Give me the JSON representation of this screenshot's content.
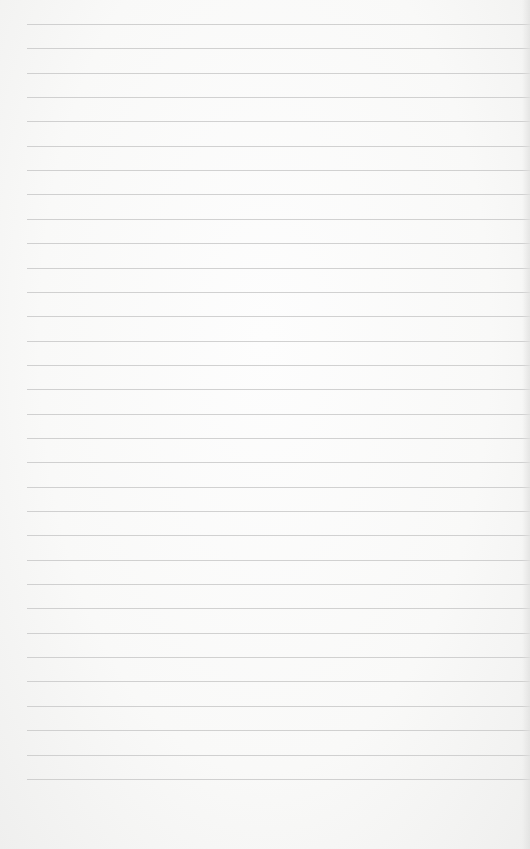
{
  "page": {
    "type": "lined-paper",
    "background_color": "#f9f9f8",
    "line_color": "#c9c9c9",
    "line_count": 32,
    "first_line_y": 24,
    "line_spacing": 24.35,
    "line_left_x": 27
  }
}
